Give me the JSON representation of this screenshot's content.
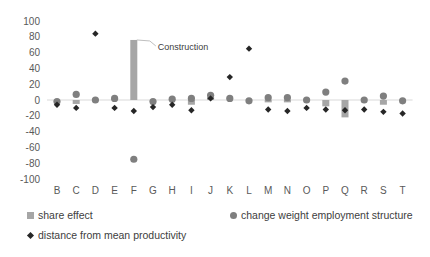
{
  "chart_data": {
    "type": "scatter",
    "title": "",
    "xlabel": "",
    "ylabel": "",
    "categories": [
      "B",
      "C",
      "D",
      "E",
      "F",
      "G",
      "H",
      "I",
      "J",
      "K",
      "L",
      "M",
      "N",
      "O",
      "P",
      "Q",
      "R",
      "S",
      "T"
    ],
    "ylim": [
      -100,
      100
    ],
    "yticks": [
      "100",
      "80",
      "60",
      "40",
      "20",
      "0",
      "-20",
      "-40",
      "-60",
      "-80",
      "-100"
    ],
    "ytick_values": [
      100,
      80,
      60,
      40,
      20,
      0,
      -20,
      -40,
      -60,
      -80,
      -100
    ],
    "grid": false,
    "series": [
      {
        "name": "share effect",
        "mark": "bar",
        "color": "#a6a6a6",
        "values": [
          0,
          -5,
          0,
          1,
          76,
          0,
          0,
          -6,
          4,
          0,
          0,
          -3,
          -3,
          0,
          -8,
          -22,
          0,
          -6,
          0
        ]
      },
      {
        "name": "change weight employment structure",
        "mark": "circle",
        "color": "#7f7f7f",
        "values": [
          -2,
          7,
          0,
          2,
          -75,
          -2,
          1,
          2,
          6,
          2,
          -1,
          3,
          3,
          0,
          10,
          24,
          0,
          5,
          -1
        ]
      },
      {
        "name": "distance from mean productivity",
        "mark": "diamond",
        "color": "#262626",
        "values": [
          -6,
          -10,
          84,
          -10,
          -14,
          -9,
          -6,
          -13,
          2,
          29,
          65,
          -12,
          -14,
          -10,
          -12,
          -13,
          -12,
          -15,
          -17
        ]
      }
    ],
    "annotations": [
      {
        "text": "Construction",
        "category": "F",
        "series": "share effect"
      }
    ],
    "legend_position": "bottom"
  },
  "legend": {
    "items": [
      {
        "label": "share effect"
      },
      {
        "label": "change weight employment structure"
      },
      {
        "label": "distance from mean productivity"
      }
    ]
  }
}
